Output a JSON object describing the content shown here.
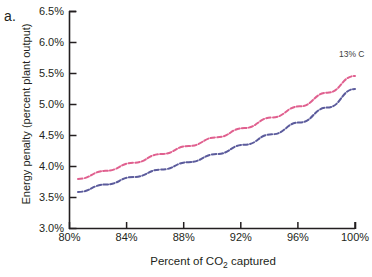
{
  "panel": {
    "label": "a."
  },
  "annotation": {
    "text": "13% C"
  },
  "chart_data": {
    "type": "line",
    "title": "",
    "xlabel": "Percent of CO₂ captured",
    "ylabel": "Energy penalty (percent plant output)",
    "xlim": [
      80,
      100
    ],
    "ylim": [
      3.0,
      6.5
    ],
    "xticks": [
      80,
      84,
      88,
      92,
      96,
      100
    ],
    "xtick_labels": [
      "80%",
      "84%",
      "88%",
      "92%",
      "96%",
      "100%"
    ],
    "yticks": [
      3.0,
      3.5,
      4.0,
      4.5,
      5.0,
      5.5,
      6.0,
      6.5
    ],
    "ytick_labels": [
      "3.0%",
      "3.5%",
      "4.0%",
      "4.5%",
      "5.0%",
      "5.5%",
      "6.0%",
      "6.5%"
    ],
    "grid": false,
    "legend": "none",
    "x": [
      80,
      82,
      84,
      86,
      88,
      90,
      92,
      94,
      96,
      98,
      100
    ],
    "series": [
      {
        "name": "upper",
        "color": "#e0608f",
        "style": "dashed",
        "values": [
          3.8,
          3.93,
          4.06,
          4.2,
          4.33,
          4.47,
          4.62,
          4.79,
          4.97,
          5.19,
          5.46
        ]
      },
      {
        "name": "lower",
        "color": "#5b5b9c",
        "style": "dashed",
        "values": [
          3.59,
          3.71,
          3.83,
          3.95,
          4.07,
          4.2,
          4.35,
          4.52,
          4.71,
          4.95,
          5.25
        ]
      }
    ]
  }
}
